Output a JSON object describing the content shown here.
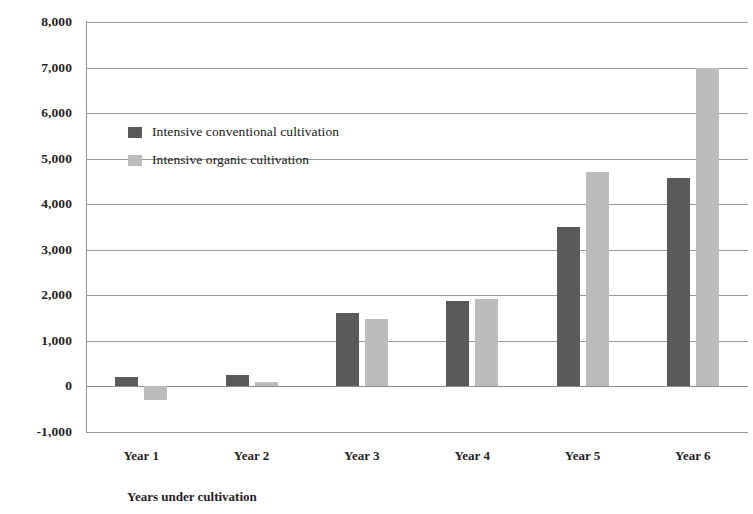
{
  "chart_data": {
    "type": "bar",
    "title": "",
    "subtitle": "",
    "xlabel": "Years under cultivation",
    "ylabel": "",
    "categories": [
      "Year 1",
      "Year 2",
      "Year 3",
      "Year 4",
      "Year 5",
      "Year 6"
    ],
    "series": [
      {
        "name": "Intensive conventional cultivation",
        "color": "#5a5a5a",
        "values": [
          200,
          250,
          1620,
          1870,
          3500,
          4570
        ]
      },
      {
        "name": "Intensive organic cultivation",
        "color": "#bcbcbc",
        "values": [
          -300,
          100,
          1490,
          1930,
          4700,
          7000
        ]
      }
    ],
    "ylim": [
      -1000,
      8000
    ],
    "ytick_values": [
      8000,
      7000,
      6000,
      5000,
      4000,
      3000,
      2000,
      1000,
      0,
      -1000
    ],
    "ytick_labels": [
      "8,000",
      "7,000",
      "6,000",
      "5,000",
      "4,000",
      "3,000",
      "2,000",
      "1,000",
      "0",
      "-1,000"
    ],
    "grid": true,
    "legend_position": "inside-upper-left",
    "annotations": []
  },
  "legend": {
    "items": [
      {
        "label": "Intensive conventional cultivation",
        "swatch": "legend-swatch-conventional"
      },
      {
        "label": "Intensive organic cultivation",
        "swatch": "legend-swatch-organic"
      }
    ]
  }
}
